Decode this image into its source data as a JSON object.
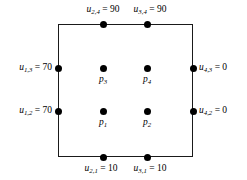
{
  "figure": {
    "background_color": "#ffffff",
    "line_color": "#1a1a1a",
    "node_color": "#000000",
    "text_color": "#000000"
  },
  "domain": {
    "shape": "square",
    "left_px": 58,
    "top_px": 24,
    "width_px": 135,
    "height_px": 133
  },
  "boundary_nodes": [
    {
      "id": "u-2-4",
      "side": "top",
      "symbol": "u",
      "sub": "2,4",
      "equals": "=",
      "value": "90",
      "text": "u2,4 = 90",
      "x_px": 103,
      "y_px": 24
    },
    {
      "id": "u-3-4",
      "side": "top",
      "symbol": "u",
      "sub": "3,4",
      "equals": "=",
      "value": "90",
      "text": "u3,4 = 90",
      "x_px": 147,
      "y_px": 24
    },
    {
      "id": "u-1-3",
      "side": "left",
      "symbol": "u",
      "sub": "1,3",
      "equals": "=",
      "value": "70",
      "text": "u1,3 = 70",
      "x_px": 58,
      "y_px": 68
    },
    {
      "id": "u-1-2",
      "side": "left",
      "symbol": "u",
      "sub": "1,2",
      "equals": "=",
      "value": "70",
      "text": "u1,2 = 70",
      "x_px": 58,
      "y_px": 111
    },
    {
      "id": "u-4-3",
      "side": "right",
      "symbol": "u",
      "sub": "4,3",
      "equals": "=",
      "value": "0",
      "text": "u4,3 = 0",
      "x_px": 193,
      "y_px": 68
    },
    {
      "id": "u-4-2",
      "side": "right",
      "symbol": "u",
      "sub": "4,2",
      "equals": "=",
      "value": "0",
      "text": "u4,2 = 0",
      "x_px": 193,
      "y_px": 111
    },
    {
      "id": "u-2-1",
      "side": "bottom",
      "symbol": "u",
      "sub": "2,1",
      "equals": "=",
      "value": "10",
      "text": "u2,1 = 10",
      "x_px": 103,
      "y_px": 157
    },
    {
      "id": "u-3-1",
      "side": "bottom",
      "symbol": "u",
      "sub": "3,1",
      "equals": "=",
      "value": "10",
      "text": "u3,1 = 10",
      "x_px": 147,
      "y_px": 157
    }
  ],
  "interior_nodes": [
    {
      "id": "p1",
      "symbol": "p",
      "sub": "1",
      "text": "p1",
      "x_px": 103,
      "y_px": 111,
      "row": "lower",
      "column": "left"
    },
    {
      "id": "p2",
      "symbol": "p",
      "sub": "2",
      "text": "p2",
      "x_px": 147,
      "y_px": 111,
      "row": "lower",
      "column": "right"
    },
    {
      "id": "p3",
      "symbol": "p",
      "sub": "3",
      "text": "p3",
      "x_px": 103,
      "y_px": 68,
      "row": "upper",
      "column": "left"
    },
    {
      "id": "p4",
      "symbol": "p",
      "sub": "4",
      "text": "p4",
      "x_px": 147,
      "y_px": 68,
      "row": "upper",
      "column": "right"
    }
  ]
}
